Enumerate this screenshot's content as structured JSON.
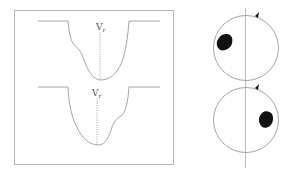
{
  "figure": {
    "left_panel": {
      "profiles": [
        {
          "label": "V",
          "label_sub": "r",
          "asymmetry": "left-shoulder"
        },
        {
          "label": "V",
          "label_sub": "r",
          "asymmetry": "right-shoulder"
        }
      ]
    },
    "right_panel": {
      "discs": [
        {
          "spot_side": "left"
        },
        {
          "spot_side": "right"
        }
      ]
    },
    "colors": {
      "line": "#9a9a9a",
      "frame": "#b0b0b0",
      "spot": "#111111",
      "axis": "#aaaaaa"
    }
  }
}
